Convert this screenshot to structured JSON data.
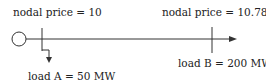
{
  "diagram": {
    "type": "two-bus power network",
    "bus_a": {
      "price_label": "nodal price = 10",
      "load_label": "load A = 50 MW"
    },
    "bus_b": {
      "price_label": "nodal price = 10.78",
      "load_label": "load B = 200 MW"
    },
    "icons": {
      "generator": "generator-circle-icon",
      "flow_arrow": "arrow-right-icon",
      "load_arrow": "arrow-down-icon"
    },
    "colors": {
      "line": "#333333",
      "text": "#222222",
      "background": "#ffffff"
    }
  }
}
